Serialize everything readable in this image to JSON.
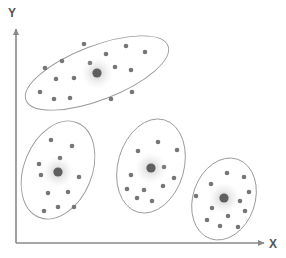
{
  "figure": {
    "title": "",
    "type": "cluster-scatter-diagram",
    "background_color": "#ffffff",
    "width": 286,
    "height": 258
  },
  "axes": {
    "x_label": "X",
    "y_label": "Y",
    "axis_color": "#8a8a8a",
    "label_color": "#555555",
    "origin": {
      "x": 16,
      "y": 243
    },
    "x_axis_end": {
      "x": 264,
      "y": 243
    },
    "y_axis_end": {
      "x": 16,
      "y": 29
    },
    "arrowheads": true,
    "ticks": [],
    "gridlines": false
  },
  "style": {
    "point_color": "#767676",
    "point_radius": 2.3,
    "centroid_color": "#5f5f5f",
    "centroid_radius": 4.6,
    "centroid_glow_color": "#b8b8b8",
    "ellipse_stroke": "#9a9a9a",
    "ellipse_fill": "none",
    "ellipse_stroke_width": 0.9
  },
  "chart_data": {
    "type": "scatter",
    "title": "",
    "xlabel": "X",
    "ylabel": "Y",
    "xlim": [
      0,
      286
    ],
    "ylim": [
      0,
      258
    ],
    "grid": false,
    "legend": null,
    "cluster_count": 4,
    "series": [
      {
        "name": "Cluster 1",
        "ellipse": {
          "cx": 97,
          "cy": 73,
          "rx": 76,
          "ry": 27,
          "rotation": -21
        },
        "centroid": {
          "x": 97,
          "y": 73
        },
        "points": [
          {
            "x": 45,
            "y": 68
          },
          {
            "x": 62,
            "y": 61
          },
          {
            "x": 56,
            "y": 79
          },
          {
            "x": 74,
            "y": 78
          },
          {
            "x": 90,
            "y": 63
          },
          {
            "x": 106,
            "y": 54
          },
          {
            "x": 126,
            "y": 46
          },
          {
            "x": 145,
            "y": 52
          },
          {
            "x": 115,
            "y": 67
          },
          {
            "x": 131,
            "y": 70
          },
          {
            "x": 40,
            "y": 92
          },
          {
            "x": 54,
            "y": 99
          },
          {
            "x": 70,
            "y": 98
          },
          {
            "x": 111,
            "y": 99
          },
          {
            "x": 132,
            "y": 92
          },
          {
            "x": 84,
            "y": 44
          }
        ]
      },
      {
        "name": "Cluster 2",
        "ellipse": {
          "cx": 58,
          "cy": 170,
          "rx": 34,
          "ry": 51,
          "rotation": 22
        },
        "centroid": {
          "x": 58,
          "y": 172
        },
        "points": [
          {
            "x": 51,
            "y": 140
          },
          {
            "x": 72,
            "y": 146
          },
          {
            "x": 60,
            "y": 158
          },
          {
            "x": 39,
            "y": 164
          },
          {
            "x": 41,
            "y": 175
          },
          {
            "x": 79,
            "y": 177
          },
          {
            "x": 68,
            "y": 192
          },
          {
            "x": 48,
            "y": 193
          },
          {
            "x": 58,
            "y": 207
          },
          {
            "x": 74,
            "y": 207
          },
          {
            "x": 44,
            "y": 211
          }
        ]
      },
      {
        "name": "Cluster 3",
        "ellipse": {
          "cx": 151,
          "cy": 166,
          "rx": 33,
          "ry": 48,
          "rotation": 16
        },
        "centroid": {
          "x": 151,
          "y": 168
        },
        "points": [
          {
            "x": 158,
            "y": 142
          },
          {
            "x": 138,
            "y": 151
          },
          {
            "x": 177,
            "y": 150
          },
          {
            "x": 131,
            "y": 175
          },
          {
            "x": 164,
            "y": 167
          },
          {
            "x": 127,
            "y": 189
          },
          {
            "x": 144,
            "y": 190
          },
          {
            "x": 163,
            "y": 186
          },
          {
            "x": 174,
            "y": 178
          },
          {
            "x": 152,
            "y": 201
          },
          {
            "x": 137,
            "y": 198
          }
        ]
      },
      {
        "name": "Cluster 4",
        "ellipse": {
          "cx": 224,
          "cy": 199,
          "rx": 31,
          "ry": 42,
          "rotation": 19
        },
        "centroid": {
          "x": 224,
          "y": 198
        },
        "points": [
          {
            "x": 227,
            "y": 173
          },
          {
            "x": 244,
            "y": 177
          },
          {
            "x": 249,
            "y": 192
          },
          {
            "x": 211,
            "y": 184
          },
          {
            "x": 196,
            "y": 196
          },
          {
            "x": 240,
            "y": 201
          },
          {
            "x": 245,
            "y": 211
          },
          {
            "x": 212,
            "y": 208
          },
          {
            "x": 228,
            "y": 216
          },
          {
            "x": 220,
            "y": 226
          },
          {
            "x": 238,
            "y": 227
          },
          {
            "x": 207,
            "y": 220
          }
        ]
      }
    ]
  }
}
